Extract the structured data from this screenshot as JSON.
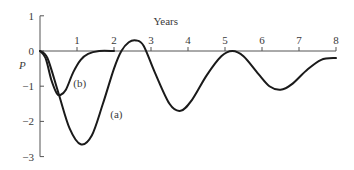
{
  "chart_data": {
    "type": "line",
    "title": "",
    "xlabel": "Years",
    "ylabel": "P",
    "xlim": [
      0,
      8
    ],
    "ylim": [
      -3,
      1
    ],
    "x_ticks": [
      "1",
      "2",
      "3",
      "4",
      "5",
      "6",
      "7",
      "8"
    ],
    "y_ticks": [
      "1",
      "0",
      "-1",
      "-2",
      "-3"
    ],
    "grid": false,
    "legend": "inline curve labels",
    "series": [
      {
        "name": "(a)",
        "x": [
          0,
          0.2,
          0.5,
          0.8,
          1.1,
          1.4,
          1.7,
          2.0,
          2.2,
          2.4,
          2.6,
          2.8,
          3.1,
          3.5,
          3.8,
          4.1,
          4.5,
          4.9,
          5.2,
          5.5,
          5.9,
          6.2,
          6.5,
          6.8,
          7.2,
          7.6,
          8.0
        ],
        "y": [
          0,
          -0.2,
          -1.2,
          -2.2,
          -2.65,
          -2.4,
          -1.5,
          -0.5,
          0.0,
          0.25,
          0.3,
          0.15,
          -0.6,
          -1.5,
          -1.7,
          -1.4,
          -0.7,
          -0.15,
          0.0,
          -0.15,
          -0.65,
          -1.0,
          -1.1,
          -0.95,
          -0.55,
          -0.25,
          -0.2
        ]
      },
      {
        "name": "(b)",
        "x": [
          0,
          0.15,
          0.3,
          0.45,
          0.55,
          0.7,
          0.9,
          1.1,
          1.3,
          1.6,
          2.0
        ],
        "y": [
          0,
          -0.2,
          -0.8,
          -1.2,
          -1.25,
          -1.1,
          -0.6,
          -0.25,
          -0.08,
          0.0,
          0.0
        ]
      }
    ],
    "annotations": [
      {
        "text": "(a)",
        "x": 1.9,
        "y": -1.8
      },
      {
        "text": "(b)",
        "x": 0.9,
        "y": -0.9
      }
    ]
  }
}
